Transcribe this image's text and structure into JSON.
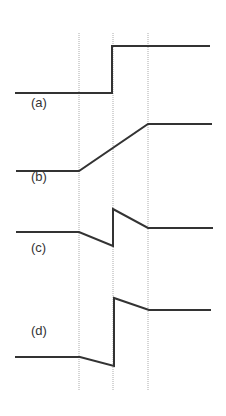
{
  "diagram": {
    "colors": {
      "line": "#333333",
      "guide": "#aaaaaa",
      "background": "#ffffff"
    },
    "guides": [
      {
        "x": 79,
        "y1": 33,
        "y2": 391
      },
      {
        "x": 113,
        "y1": 33,
        "y2": 391
      },
      {
        "x": 148,
        "y1": 33,
        "y2": 391
      }
    ],
    "signals": [
      {
        "id": "a",
        "label": "(a)",
        "label_pos": [
          31,
          103
        ],
        "points": "15,93 112,93 112,46 210,46"
      },
      {
        "id": "b",
        "label": "(b)",
        "label_pos": [
          31,
          177
        ],
        "points": "16,171 79,171 148,124 212,124"
      },
      {
        "id": "c",
        "label": "(c)",
        "label_pos": [
          31,
          248
        ],
        "points": "16,232 79,232 113,246 113,209 148,228 213,228"
      },
      {
        "id": "d",
        "label": "(d)",
        "label_pos": [
          31,
          331
        ],
        "points": "15,357 80,357 114,366 114,298 149,310 211,310"
      }
    ]
  }
}
